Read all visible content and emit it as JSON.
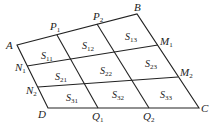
{
  "diagram": {
    "vertices": {
      "A": {
        "label": "A",
        "x": 17,
        "y": 45
      },
      "B": {
        "label": "B",
        "x": 137,
        "y": 14
      },
      "C": {
        "label": "C",
        "x": 199,
        "y": 108
      },
      "D": {
        "label": "D",
        "x": 48,
        "y": 108
      }
    },
    "edge_points": {
      "P1": {
        "label": "P",
        "sub": "1"
      },
      "P2": {
        "label": "P",
        "sub": "2"
      },
      "M1": {
        "label": "M",
        "sub": "1"
      },
      "M2": {
        "label": "M",
        "sub": "2"
      },
      "N1": {
        "label": "N",
        "sub": "1"
      },
      "N2": {
        "label": "N",
        "sub": "2"
      },
      "Q1": {
        "label": "Q",
        "sub": "1"
      },
      "Q2": {
        "label": "Q",
        "sub": "2"
      }
    },
    "cells": [
      {
        "label": "S",
        "sub": "11"
      },
      {
        "label": "S",
        "sub": "12"
      },
      {
        "label": "S",
        "sub": "13"
      },
      {
        "label": "S",
        "sub": "21"
      },
      {
        "label": "S",
        "sub": "22"
      },
      {
        "label": "S",
        "sub": "23"
      },
      {
        "label": "S",
        "sub": "31"
      },
      {
        "label": "S",
        "sub": "32"
      },
      {
        "label": "S",
        "sub": "33"
      }
    ],
    "line_color": "#222222"
  }
}
